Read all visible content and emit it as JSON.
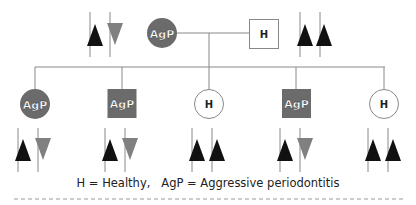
{
  "colors": {
    "affected_fill": "#6b6b6b",
    "healthy_fill": "#ffffff",
    "line": "#888888",
    "allele_dominant": "#111111",
    "allele_recessive": "#808080"
  },
  "parents": [
    {
      "id": "mother",
      "shape": "circle",
      "label": "AgP",
      "status": "affected",
      "alleles": [
        "up-black",
        "down-gray"
      ]
    },
    {
      "id": "father",
      "shape": "square",
      "label": "H",
      "status": "healthy",
      "alleles": [
        "up-black",
        "up-black"
      ]
    }
  ],
  "children": [
    {
      "shape": "circle",
      "label": "AgP",
      "status": "affected",
      "alleles": [
        "up-black",
        "down-gray"
      ]
    },
    {
      "shape": "square",
      "label": "AgP",
      "status": "affected",
      "alleles": [
        "up-black",
        "down-gray"
      ]
    },
    {
      "shape": "circle",
      "label": "H",
      "status": "healthy",
      "alleles": [
        "up-black",
        "up-black"
      ]
    },
    {
      "shape": "square",
      "label": "AgP",
      "status": "affected",
      "alleles": [
        "up-black",
        "down-gray"
      ]
    },
    {
      "shape": "circle",
      "label": "H",
      "status": "healthy",
      "alleles": [
        "up-black",
        "up-black"
      ]
    }
  ],
  "legend": {
    "text": "H = Healthy,   AgP = Aggressive periodontitis"
  }
}
